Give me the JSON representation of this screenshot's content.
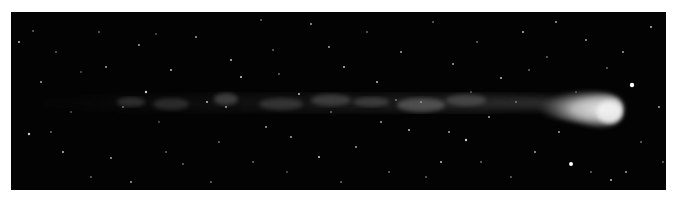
{
  "image": {
    "subject": "comet with long ion tail against star field",
    "background_color": "#ffffff",
    "frame_color": "#030303",
    "comet_head_color": "#e8e8e8",
    "tail_color": "#9a9a9a",
    "star_color": "#ffffff"
  },
  "stars": [
    [
      8,
      30,
      1
    ],
    [
      22,
      19,
      0.8
    ],
    [
      30,
      70,
      0.9
    ],
    [
      40,
      120,
      0.8
    ],
    [
      52,
      140,
      1
    ],
    [
      18,
      122,
      1.2
    ],
    [
      70,
      60,
      0.7
    ],
    [
      88,
      20,
      0.8
    ],
    [
      100,
      146,
      0.9
    ],
    [
      112,
      95,
      0.8
    ],
    [
      128,
      33,
      0.9
    ],
    [
      135,
      80,
      1.2
    ],
    [
      148,
      110,
      0.7
    ],
    [
      160,
      58,
      1
    ],
    [
      172,
      152,
      0.8
    ],
    [
      185,
      25,
      0.9
    ],
    [
      196,
      90,
      1
    ],
    [
      208,
      130,
      0.8
    ],
    [
      220,
      48,
      1
    ],
    [
      230,
      65,
      1.1
    ],
    [
      242,
      150,
      0.8
    ],
    [
      255,
      115,
      0.9
    ],
    [
      262,
      38,
      0.8
    ],
    [
      276,
      160,
      0.7
    ],
    [
      288,
      82,
      1
    ],
    [
      300,
      12,
      0.9
    ],
    [
      308,
      145,
      1.1
    ],
    [
      320,
      100,
      0.8
    ],
    [
      333,
      55,
      1
    ],
    [
      345,
      135,
      0.9
    ],
    [
      356,
      20,
      0.8
    ],
    [
      366,
      70,
      1
    ],
    [
      378,
      160,
      0.8
    ],
    [
      390,
      40,
      0.9
    ],
    [
      398,
      118,
      1
    ],
    [
      410,
      90,
      0.8
    ],
    [
      422,
      10,
      0.8
    ],
    [
      430,
      150,
      1
    ],
    [
      442,
      52,
      0.9
    ],
    [
      455,
      128,
      1.2
    ],
    [
      466,
      30,
      0.8
    ],
    [
      478,
      105,
      0.9
    ],
    [
      490,
      66,
      1
    ],
    [
      500,
      165,
      0.8
    ],
    [
      512,
      20,
      1
    ],
    [
      524,
      140,
      0.9
    ],
    [
      536,
      45,
      0.8
    ],
    [
      548,
      120,
      0.9
    ],
    [
      560,
      152,
      2
    ],
    [
      575,
      28,
      0.9
    ],
    [
      588,
      105,
      0.8
    ],
    [
      600,
      168,
      1
    ],
    [
      612,
      40,
      0.9
    ],
    [
      621,
      73,
      2.2
    ],
    [
      630,
      130,
      0.8
    ],
    [
      640,
      15,
      1
    ],
    [
      648,
      95,
      0.9
    ],
    [
      652,
      150,
      0.8
    ],
    [
      60,
      100,
      0.7
    ],
    [
      80,
      165,
      0.8
    ],
    [
      120,
      170,
      0.9
    ],
    [
      145,
      22,
      0.7
    ],
    [
      200,
      170,
      0.8
    ],
    [
      250,
      8,
      0.8
    ],
    [
      280,
      125,
      0.9
    ],
    [
      330,
      170,
      0.8
    ],
    [
      370,
      110,
      0.9
    ],
    [
      415,
      165,
      0.8
    ],
    [
      460,
      80,
      0.7
    ],
    [
      505,
      90,
      0.8
    ],
    [
      545,
      10,
      0.9
    ],
    [
      580,
      160,
      0.8
    ],
    [
      596,
      56,
      0.8
    ],
    [
      615,
      160,
      0.9
    ],
    [
      155,
      140,
      0.8
    ],
    [
      95,
      55,
      0.9
    ],
    [
      45,
      40,
      0.8
    ],
    [
      215,
      95,
      0.9
    ],
    [
      268,
      62,
      0.8
    ],
    [
      318,
      35,
      0.9
    ],
    [
      385,
      88,
      0.8
    ],
    [
      438,
      120,
      0.9
    ],
    [
      470,
      150,
      0.8
    ],
    [
      518,
      58,
      0.8
    ],
    [
      565,
      80,
      0.7
    ]
  ],
  "tail_knots": [
    [
      120,
      90,
      14,
      5,
      0.25
    ],
    [
      160,
      92,
      18,
      6,
      0.22
    ],
    [
      215,
      87,
      12,
      6,
      0.35
    ],
    [
      270,
      92,
      22,
      6,
      0.25
    ],
    [
      320,
      88,
      20,
      6,
      0.3
    ],
    [
      360,
      90,
      18,
      5,
      0.28
    ],
    [
      410,
      93,
      24,
      7,
      0.4
    ],
    [
      455,
      88,
      20,
      6,
      0.3
    ]
  ]
}
